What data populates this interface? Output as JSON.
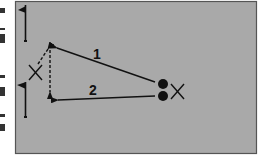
{
  "diagram": {
    "type": "drill-diagram",
    "field": {
      "fill": "#a9a9a9",
      "border": "#555555"
    },
    "labels": {
      "pass1": "1",
      "pass2": "2"
    },
    "elements": [
      {
        "kind": "flag",
        "position": "top-left"
      },
      {
        "kind": "flag",
        "position": "bottom-left"
      },
      {
        "kind": "player-x",
        "position": "left",
        "label": "X"
      },
      {
        "kind": "player-x",
        "position": "right",
        "label": "X"
      },
      {
        "kind": "ball",
        "count": 2
      },
      {
        "kind": "arrow",
        "style": "solid",
        "label": "1"
      },
      {
        "kind": "arrow",
        "style": "solid",
        "label": "2"
      },
      {
        "kind": "arrow",
        "style": "dashed"
      },
      {
        "kind": "arrow",
        "style": "dashed"
      }
    ]
  }
}
